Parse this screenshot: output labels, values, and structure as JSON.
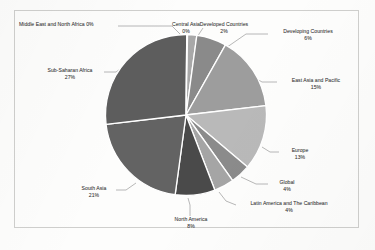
{
  "chart_data": {
    "type": "pie",
    "title": "",
    "subtitle": "",
    "xlabel": "",
    "ylabel": "",
    "legend_position": "none",
    "grid": false,
    "label_format": "name + percent",
    "categories": [
      "Central Asia",
      "Developed Countries",
      "Developing Countries",
      "East Asia and Pacific",
      "Europe",
      "Global",
      "Latin America and The Caribbean",
      "North America",
      "South Asia",
      "Sub-Saharan Africa",
      "Middle East and North Africa"
    ],
    "values": [
      0,
      2,
      6,
      15,
      13,
      4,
      4,
      8,
      21,
      27,
      0
    ],
    "slices": [
      {
        "label": "Central Asia",
        "percent": 0,
        "percent_text": "0%",
        "color": "#8d8d8d"
      },
      {
        "label": "Developed Countries",
        "percent": 2,
        "percent_text": "2%",
        "color": "#a8a8a8"
      },
      {
        "label": "Developing Countries",
        "percent": 6,
        "percent_text": "6%",
        "color": "#8a8a8a"
      },
      {
        "label": "East Asia and Pacific",
        "percent": 15,
        "percent_text": "15%",
        "color": "#9d9d9d"
      },
      {
        "label": "Europe",
        "percent": 13,
        "percent_text": "13%",
        "color": "#b9b9b9"
      },
      {
        "label": "Global",
        "percent": 4,
        "percent_text": "4%",
        "color": "#8b8b8b"
      },
      {
        "label": "Latin America and The Caribbean",
        "percent": 4,
        "percent_text": "4%",
        "color": "#a5a5a5"
      },
      {
        "label": "North America",
        "percent": 8,
        "percent_text": "8%",
        "color": "#4a4a4a"
      },
      {
        "label": "South Asia",
        "percent": 21,
        "percent_text": "21%",
        "color": "#636363"
      },
      {
        "label": "Sub-Saharan Africa",
        "percent": 27,
        "percent_text": "27%",
        "color": "#5d5d5d"
      },
      {
        "label": "Middle East and North Africa",
        "percent": 0,
        "percent_text": "0%",
        "color": "#6b6b6b"
      }
    ],
    "colors": {
      "background": "#fdfdfc",
      "frame_border": "#cfcfcd",
      "slice_outline": "#ffffff",
      "label_text": "#464646",
      "leader_line": "#7d7d7d"
    }
  },
  "labels": {
    "middle_east_north_africa": {
      "name": "Middle East and North Africa 0%",
      "percent": "0%"
    },
    "central_asia": {
      "name": "Central Asia",
      "percent": "0%"
    },
    "developed_countries": {
      "name": "Developed Countries",
      "percent": "2%"
    },
    "developing_countries": {
      "name": "Developing Countries",
      "percent": "6%"
    },
    "east_asia_pacific": {
      "name": "East Asia and Pacific",
      "percent": "15%"
    },
    "europe": {
      "name": "Europe",
      "percent": "13%"
    },
    "global": {
      "name": "Global",
      "percent": "4%"
    },
    "latin_america_caribbean": {
      "name": "Latin America and The Caribbean",
      "percent": "4%"
    },
    "north_america": {
      "name": "North America",
      "percent": "8%"
    },
    "south_asia": {
      "name": "South Asia",
      "percent": "21%"
    },
    "sub_saharan_africa": {
      "name": "Sub-Saharan Africa",
      "percent": "27%"
    }
  }
}
